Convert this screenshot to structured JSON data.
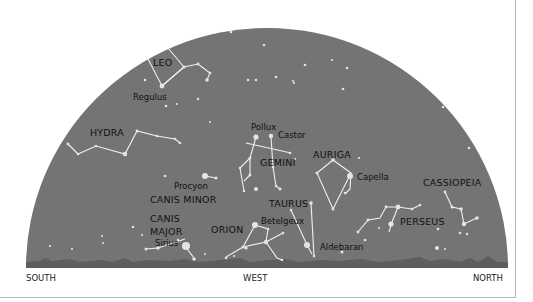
{
  "colors": {
    "sky": "#747474",
    "star": "#e4e4e4",
    "line": "#f0f0f0",
    "label": "#111111",
    "horizon": "#5e5e5e",
    "frame": "#b8b8b8"
  },
  "directions": {
    "south": "SOUTH",
    "west": "WEST",
    "north": "NORTH"
  },
  "constellations": {
    "leo": "LEO",
    "hydra": "HYDRA",
    "gemini": "GEMINI",
    "auriga": "AURIGA",
    "canis_minor": "CANIS MINOR",
    "canis_major_1": "CANIS",
    "canis_major_2": "MAJOR",
    "orion": "ORION",
    "taurus": "TAURUS",
    "perseus": "PERSEUS",
    "cassiopeia": "CASSIOPEIA"
  },
  "stars": {
    "regulus": "Regulus",
    "pollux": "Pollux",
    "castor": "Castor",
    "procyon": "Procyon",
    "capella": "Capella",
    "sirius": "Sirius",
    "betelgeux": "Betelgeux",
    "aldebaran": "Aldebaran"
  }
}
